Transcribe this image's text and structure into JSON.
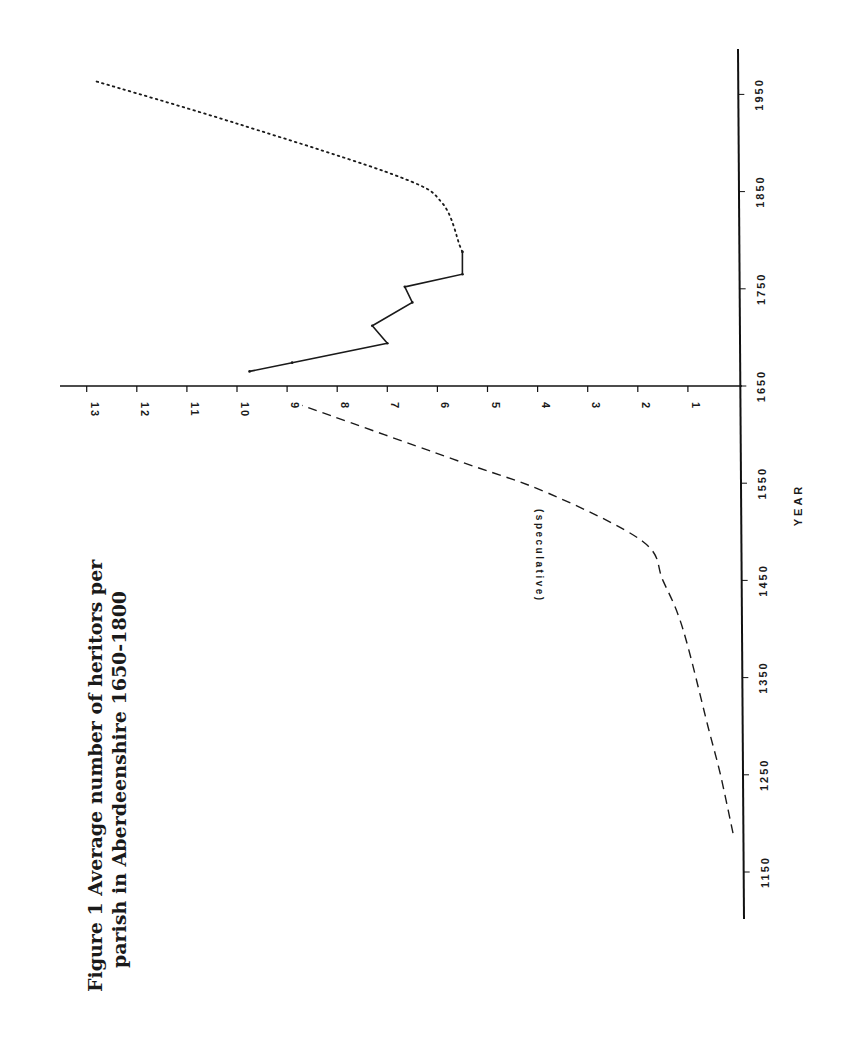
{
  "figure": {
    "title_line1": "Figure 1   Average number of heritors per",
    "title_line2": "parish in Aberdeenshire 1650-1800"
  },
  "chart_data": {
    "type": "line",
    "orientation": "rotated 90° (year axis vertical, value axis horizontal)",
    "title": "Figure 1 Average number of heritors per parish in Aberdeenshire 1650-1800",
    "xlabel": "YEAR",
    "ylabel": "",
    "x_ticks": [
      1150,
      1250,
      1350,
      1450,
      1550,
      1650,
      1750,
      1850,
      1950
    ],
    "y_ticks": [
      1,
      2,
      3,
      4,
      5,
      6,
      7,
      8,
      9,
      10,
      11,
      12,
      13
    ],
    "xlim": [
      1100,
      1980
    ],
    "ylim": [
      0,
      13.5
    ],
    "grid": false,
    "legend": null,
    "annotations": [
      {
        "text": "(speculative)",
        "near_series": "speculative"
      }
    ],
    "series": [
      {
        "name": "speculative",
        "style": "dashed",
        "points": [
          {
            "year": 1190,
            "value": 0.1
          },
          {
            "year": 1250,
            "value": 0.35
          },
          {
            "year": 1300,
            "value": 0.6
          },
          {
            "year": 1400,
            "value": 1.1
          },
          {
            "year": 1450,
            "value": 1.5
          },
          {
            "year": 1490,
            "value": 1.9
          },
          {
            "year": 1540,
            "value": 3.8
          },
          {
            "year": 1575,
            "value": 5.7
          },
          {
            "year": 1630,
            "value": 8.7
          }
        ]
      },
      {
        "name": "observed",
        "style": "solid",
        "points": [
          {
            "year": 1665,
            "value": 9.75
          },
          {
            "year": 1674,
            "value": 8.9
          },
          {
            "year": 1694,
            "value": 7.0
          },
          {
            "year": 1712,
            "value": 7.3
          },
          {
            "year": 1736,
            "value": 6.5
          },
          {
            "year": 1752,
            "value": 6.65
          },
          {
            "year": 1765,
            "value": 5.5
          },
          {
            "year": 1788,
            "value": 5.5
          }
        ]
      },
      {
        "name": "projected",
        "style": "dotted",
        "points": [
          {
            "year": 1788,
            "value": 5.5
          },
          {
            "year": 1794,
            "value": 5.55
          },
          {
            "year": 1838,
            "value": 5.9
          },
          {
            "year": 1865,
            "value": 6.75
          },
          {
            "year": 1920,
            "value": 10.0
          },
          {
            "year": 1964,
            "value": 12.85
          }
        ]
      }
    ]
  }
}
